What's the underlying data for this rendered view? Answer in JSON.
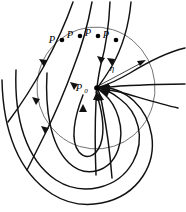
{
  "figure": {
    "name": "phase-portrait-convergence-diagram",
    "background_color": "#ffffff",
    "width": 186,
    "height": 212
  },
  "colors": {
    "trajectory": "#111111",
    "neighborhood_circle": "#555555",
    "point": "#000000",
    "label": "#000000"
  },
  "labels": {
    "p_points": [
      {
        "id": "p-label-1",
        "text": "P",
        "x": 52,
        "y": 43,
        "dot_x": 62,
        "dot_y": 40
      },
      {
        "id": "p-label-2",
        "text": "P",
        "x": 70,
        "y": 38,
        "dot_x": 80,
        "dot_y": 36
      },
      {
        "id": "p-label-3",
        "text": "P",
        "x": 88,
        "y": 36,
        "dot_x": 98,
        "dot_y": 36
      },
      {
        "id": "p-label-4",
        "text": "P",
        "x": 106,
        "y": 38,
        "dot_x": 116,
        "dot_y": 40
      }
    ],
    "fixed_point": {
      "id": "p-zero-label",
      "text": "P",
      "subscript": "0",
      "x": 79,
      "y": 91,
      "dot_x": 97,
      "dot_y": 88,
      "dot_radius": 2.6
    },
    "radius": {
      "id": "eta-label",
      "text": "η",
      "x": 112,
      "y": 71
    }
  },
  "neighborhood": {
    "center_x": 96,
    "center_y": 88,
    "radius_x": 59,
    "radius_y": 61,
    "rotation": -6
  },
  "radius_arrow": {
    "from_x": 100,
    "from_y": 85,
    "to_x": 146,
    "to_y": 61
  },
  "point_radius": 2.3
}
